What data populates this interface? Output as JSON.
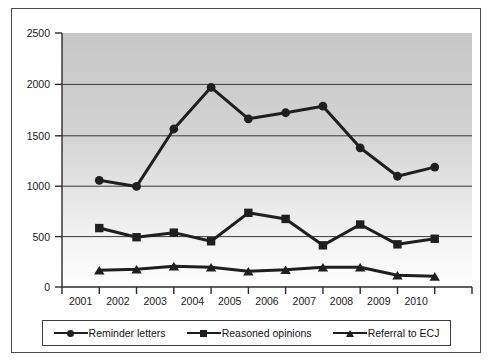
{
  "chart_data": {
    "type": "line",
    "title": "",
    "subtitle": "",
    "xlabel": "",
    "ylabel": "",
    "categories": [
      "2001",
      "2002",
      "2003",
      "2004",
      "2005",
      "2006",
      "2007",
      "2008",
      "2009",
      "2010"
    ],
    "ylim": [
      0,
      2500
    ],
    "yticks": [
      0,
      500,
      1000,
      1500,
      2000,
      2500
    ],
    "ytick_labels": [
      "0",
      "500",
      "1000",
      "1500",
      "2000",
      "2500"
    ],
    "grid": true,
    "grid_axis": "y",
    "legend_position": "bottom",
    "plot_background": "gray-gradient-top-dark",
    "series": [
      {
        "name": "Reminder letters",
        "marker": "circle",
        "color": "#1f1f1f",
        "values": [
          1050,
          990,
          1555,
          1965,
          1655,
          1715,
          1780,
          1370,
          1090,
          1180
        ]
      },
      {
        "name": "Reasoned opinions",
        "marker": "square",
        "color": "#1f1f1f",
        "values": [
          580,
          490,
          535,
          450,
          730,
          670,
          410,
          615,
          420,
          475
        ]
      },
      {
        "name": "Referral to ECJ",
        "marker": "triangle",
        "color": "#1f1f1f",
        "values": [
          165,
          175,
          205,
          195,
          155,
          170,
          195,
          195,
          115,
          105
        ]
      }
    ]
  },
  "legend": {
    "items": [
      {
        "label": "Reminder letters",
        "marker": "circle"
      },
      {
        "label": "Reasoned opinions",
        "marker": "square"
      },
      {
        "label": "Referral to ECJ",
        "marker": "triangle"
      }
    ]
  },
  "colors": {
    "series_line": "#1f1f1f",
    "gridline": "#3a3a3a",
    "axis": "#2b2b2b",
    "frame": "#4a4a4a",
    "plot_top": "#c9c9c9",
    "plot_bottom": "#ffffff"
  }
}
